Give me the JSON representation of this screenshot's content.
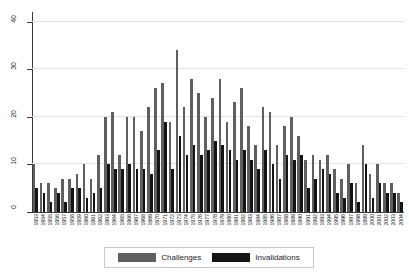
{
  "chart_data": {
    "type": "bar",
    "title": "",
    "xlabel": "",
    "ylabel": "",
    "ylim": [
      0,
      42
    ],
    "yticks": [
      0,
      10,
      20,
      30,
      40
    ],
    "grid": true,
    "legend_position": "bottom-center",
    "categories": [
      "1953",
      "1954",
      "1955",
      "1956",
      "1957",
      "1958",
      "1959",
      "1960",
      "1961",
      "1962",
      "1963",
      "1964",
      "1965",
      "1966",
      "1967",
      "1968",
      "1969",
      "1970",
      "1971",
      "1972",
      "1973",
      "1974",
      "1975",
      "1976",
      "1977",
      "1978",
      "1979",
      "1980",
      "1981",
      "1982",
      "1983",
      "1984",
      "1985",
      "1986",
      "1987",
      "1988",
      "1989",
      "1990",
      "1991",
      "1992",
      "1993",
      "1994",
      "1995",
      "1996",
      "1997",
      "1998",
      "1999",
      "2000",
      "2001",
      "2002",
      "2003",
      "2004"
    ],
    "series": [
      {
        "name": "Challenges",
        "color": "#5f5f5f",
        "values": [
          10,
          6,
          6,
          5,
          7,
          7,
          8,
          10,
          7,
          12,
          20,
          21,
          12,
          20,
          20,
          17,
          22,
          26,
          27,
          19,
          34,
          22,
          28,
          25,
          20,
          24,
          28,
          19,
          23,
          26,
          18,
          14,
          22,
          21,
          14,
          18,
          20,
          16,
          11,
          12,
          11,
          12,
          9,
          7,
          10,
          6,
          14,
          8,
          10,
          6,
          6,
          4
        ]
      },
      {
        "name": "Invalidations",
        "color": "#141414",
        "values": [
          5,
          4,
          2,
          4,
          2,
          5,
          5,
          3,
          4,
          5,
          10,
          9,
          9,
          10,
          9,
          9,
          8,
          13,
          19,
          9,
          16,
          12,
          14,
          12,
          13,
          15,
          14,
          13,
          11,
          13,
          11,
          9,
          13,
          10,
          7,
          12,
          11,
          12,
          5,
          7,
          9,
          8,
          4,
          3,
          6,
          2,
          10,
          3,
          6,
          4,
          4,
          2
        ]
      }
    ],
    "legend": [
      {
        "label": "Challenges",
        "color": "#5f5f5f"
      },
      {
        "label": "Invalidations",
        "color": "#141414"
      }
    ]
  }
}
